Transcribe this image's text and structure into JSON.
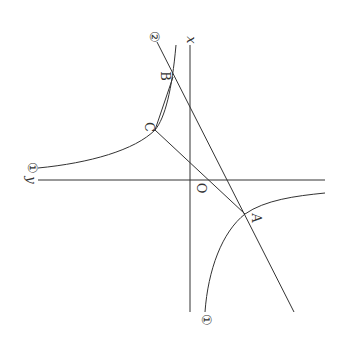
{
  "diagram": {
    "type": "graph of inverse-proportion curve and lines (rotated 90°)",
    "colors": {
      "stroke": "#333333",
      "background": "#ffffff"
    },
    "axes": {
      "x_label": "x",
      "y_label": "y",
      "origin_label": "O"
    },
    "curve_label": "①",
    "curve_label_bottom": "①",
    "line_label": "②",
    "points": [
      {
        "name": "A",
        "label": "A"
      },
      {
        "name": "B",
        "label": "B"
      },
      {
        "name": "C",
        "label": "C"
      }
    ],
    "segments": [
      "CA",
      "CB"
    ]
  }
}
